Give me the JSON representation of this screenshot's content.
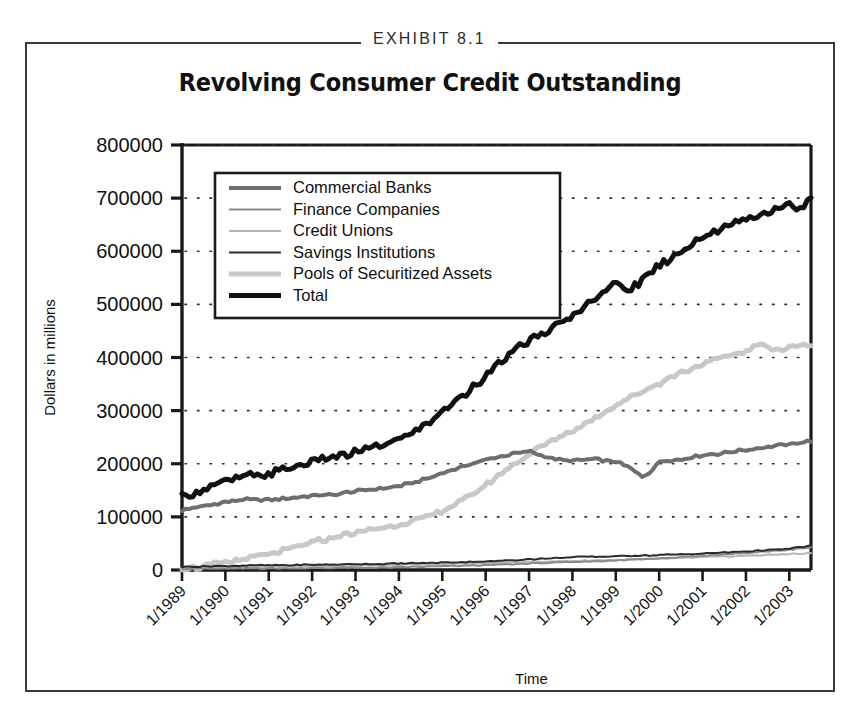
{
  "exhibit": {
    "label": "EXHIBIT 8.1"
  },
  "chart_data": {
    "type": "line",
    "title": "Revolving Consumer Credit Outstanding",
    "xlabel": "Time",
    "ylabel": "Dollars in millions",
    "ylim": [
      0,
      800000
    ],
    "ytick_labels": [
      "0",
      "100000",
      "200000",
      "300000",
      "400000",
      "500000",
      "600000",
      "700000",
      "800000"
    ],
    "ytick_values": [
      0,
      100000,
      200000,
      300000,
      400000,
      500000,
      600000,
      700000,
      800000
    ],
    "grid": true,
    "grid_style": "dotted-horizontal",
    "legend_position": "upper-left-inside",
    "categories": [
      "1/1989",
      "1/1990",
      "1/1991",
      "1/1992",
      "1/1993",
      "1/1994",
      "1/1995",
      "1/1996",
      "1/1997",
      "1/1998",
      "1/1999",
      "1/2000",
      "1/2001",
      "1/2002",
      "1/2003"
    ],
    "x_start": 1989.0,
    "x_end": 2003.5,
    "xtick_rotation_deg": -45,
    "series": [
      {
        "name": "Commercial Banks",
        "color": "#6e6e6e",
        "width": 4,
        "x": [
          1989.0,
          1989.5,
          1990.0,
          1990.5,
          1991.0,
          1991.5,
          1992.0,
          1992.5,
          1993.0,
          1993.5,
          1994.0,
          1994.5,
          1995.0,
          1995.5,
          1996.0,
          1996.5,
          1997.0,
          1997.3,
          1997.6,
          1998.0,
          1998.5,
          1999.0,
          1999.3,
          1999.6,
          1999.8,
          2000.0,
          2000.5,
          2001.0,
          2001.5,
          2002.0,
          2002.5,
          2003.0,
          2003.5
        ],
        "values": [
          113000,
          120000,
          128000,
          133000,
          132000,
          136000,
          140000,
          142000,
          148000,
          152000,
          158000,
          168000,
          182000,
          196000,
          208000,
          216000,
          224000,
          215000,
          208000,
          206000,
          208000,
          204000,
          193000,
          176000,
          184000,
          205000,
          208000,
          216000,
          220000,
          226000,
          232000,
          236000,
          243000
        ]
      },
      {
        "name": "Finance Companies",
        "color": "#8a8a8a",
        "width": 2,
        "x": [
          1989.0,
          1990.0,
          1991.0,
          1992.0,
          1993.0,
          1994.0,
          1995.0,
          1996.0,
          1997.0,
          1998.0,
          1999.0,
          2000.0,
          2001.0,
          2002.0,
          2003.0,
          2003.5
        ],
        "values": [
          2000,
          2500,
          3000,
          3500,
          4200,
          5000,
          7000,
          9000,
          12000,
          15000,
          18000,
          22000,
          27000,
          32000,
          38000,
          42000
        ]
      },
      {
        "name": "Credit Unions",
        "color": "#b5b5b5",
        "width": 2,
        "x": [
          1989.0,
          1990.0,
          1991.0,
          1992.0,
          1993.0,
          1994.0,
          1995.0,
          1996.0,
          1997.0,
          1998.0,
          1999.0,
          2000.0,
          2001.0,
          2002.0,
          2003.0,
          2003.5
        ],
        "values": [
          4000,
          5000,
          6000,
          7000,
          8000,
          9500,
          11000,
          13000,
          15000,
          17000,
          19000,
          21000,
          24000,
          27000,
          30000,
          32000
        ]
      },
      {
        "name": "Savings Institutions",
        "color": "#2b2b2b",
        "width": 2,
        "x": [
          1989.0,
          1990.0,
          1991.0,
          1992.0,
          1993.0,
          1994.0,
          1995.0,
          1996.0,
          1997.0,
          1998.0,
          1999.0,
          2000.0,
          2001.0,
          2002.0,
          2003.0,
          2003.5
        ],
        "values": [
          6000,
          7500,
          9000,
          10000,
          11000,
          12000,
          14000,
          16000,
          20000,
          24000,
          26000,
          28000,
          31000,
          35000,
          40000,
          46000
        ]
      },
      {
        "name": "Pools of Securitized Assets",
        "color": "#c8c8c8",
        "width": 5,
        "x": [
          1989.0,
          1989.5,
          1990.0,
          1990.5,
          1991.0,
          1991.5,
          1992.0,
          1992.5,
          1993.0,
          1993.5,
          1994.0,
          1994.5,
          1995.0,
          1995.5,
          1996.0,
          1996.5,
          1997.0,
          1997.5,
          1998.0,
          1998.5,
          1999.0,
          1999.5,
          2000.0,
          2000.5,
          2001.0,
          2001.5,
          2002.0,
          2002.3,
          2002.8,
          2003.0,
          2003.5
        ],
        "values": [
          2000,
          6000,
          14000,
          22000,
          30000,
          40000,
          52000,
          62000,
          70000,
          78000,
          86000,
          96000,
          110000,
          132000,
          160000,
          190000,
          218000,
          242000,
          262000,
          285000,
          310000,
          332000,
          352000,
          372000,
          388000,
          400000,
          412000,
          425000,
          414000,
          420000,
          424000
        ]
      },
      {
        "name": "Total",
        "color": "#111111",
        "width": 5,
        "x": [
          1989.0,
          1989.5,
          1990.0,
          1990.5,
          1991.0,
          1991.5,
          1992.0,
          1992.5,
          1993.0,
          1993.5,
          1994.0,
          1994.5,
          1995.0,
          1995.5,
          1996.0,
          1996.5,
          1997.0,
          1997.5,
          1998.0,
          1998.5,
          1999.0,
          1999.3,
          1999.6,
          2000.0,
          2000.5,
          2001.0,
          2001.5,
          2002.0,
          2002.5,
          2003.0,
          2003.2,
          2003.5
        ],
        "values": [
          137000,
          152000,
          166000,
          176000,
          180000,
          192000,
          204000,
          212000,
          222000,
          232000,
          246000,
          268000,
          296000,
          330000,
          366000,
          400000,
          432000,
          452000,
          478000,
          512000,
          538000,
          526000,
          545000,
          575000,
          600000,
          625000,
          648000,
          660000,
          672000,
          688000,
          676000,
          700000
        ]
      }
    ]
  }
}
